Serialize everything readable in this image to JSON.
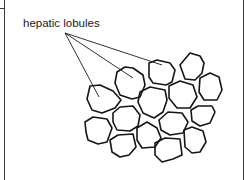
{
  "diagram": {
    "title": "Hepatic lobules",
    "label": "hepatic lobules",
    "pointer_targets": [
      "lobule-a",
      "lobule-b",
      "lobule-c"
    ],
    "lobules": [
      {
        "id": "lobule-a",
        "pointed": true
      },
      {
        "id": "lobule-b",
        "pointed": true
      },
      {
        "id": "lobule-c",
        "pointed": true
      },
      {
        "id": "lobule-d",
        "pointed": false
      },
      {
        "id": "lobule-e",
        "pointed": false
      },
      {
        "id": "lobule-f",
        "pointed": false
      },
      {
        "id": "lobule-g",
        "pointed": false
      },
      {
        "id": "lobule-h",
        "pointed": false
      },
      {
        "id": "lobule-i",
        "pointed": false
      },
      {
        "id": "lobule-j",
        "pointed": false
      },
      {
        "id": "lobule-k",
        "pointed": false
      },
      {
        "id": "lobule-l",
        "pointed": false
      },
      {
        "id": "lobule-m",
        "pointed": false
      },
      {
        "id": "lobule-n",
        "pointed": false
      },
      {
        "id": "lobule-o",
        "pointed": false
      }
    ],
    "colors": {
      "line": "#161616",
      "background": "#ffffff"
    }
  }
}
